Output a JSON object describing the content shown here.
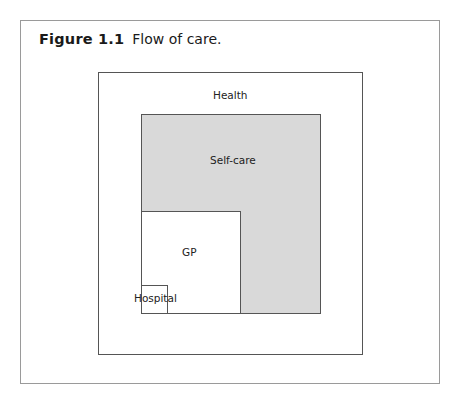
{
  "figure": {
    "label": "Figure 1.1",
    "caption": "Flow of care."
  },
  "diagram": {
    "boxes": [
      {
        "id": "health",
        "label": "Health",
        "fill": "#ffffff"
      },
      {
        "id": "self-care",
        "label": "Self-care",
        "fill": "#d9d9d9"
      },
      {
        "id": "gp",
        "label": "GP",
        "fill": "#ffffff"
      },
      {
        "id": "hospital",
        "label": "Hospital",
        "fill": "#ffffff"
      }
    ],
    "colors": {
      "border": "#555555",
      "frame": "#9a9a9a",
      "shaded": "#d9d9d9"
    }
  }
}
